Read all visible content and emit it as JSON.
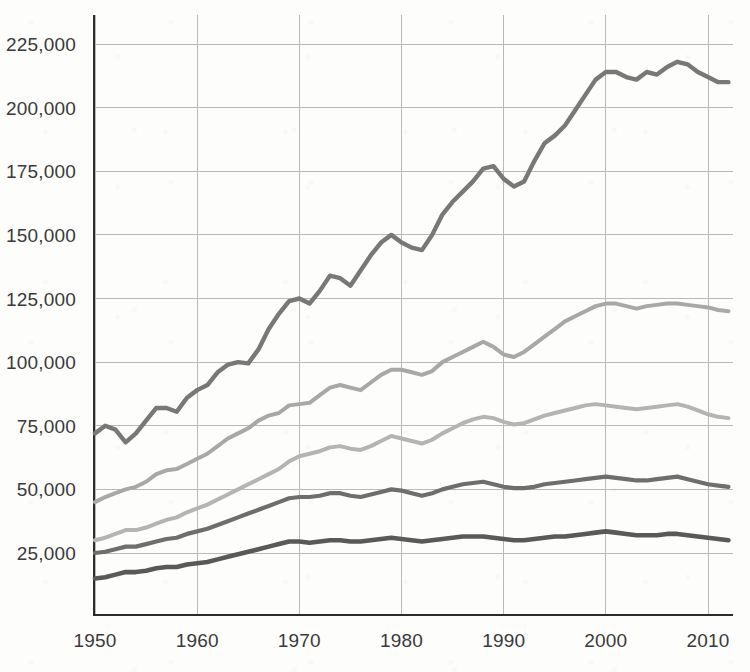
{
  "chart_data": {
    "type": "line",
    "title": "",
    "subtitle": "",
    "xlabel": "",
    "ylabel": "",
    "xlim": [
      1950,
      2012
    ],
    "ylim": [
      0,
      237000
    ],
    "grid": true,
    "legend": "none",
    "y_ticks": [
      25000,
      50000,
      75000,
      100000,
      125000,
      150000,
      175000,
      200000,
      225000
    ],
    "y_tick_labels": [
      "25,000",
      "50,000",
      "75,000",
      "100,000",
      "125,000",
      "150,000",
      "175,000",
      "200,000",
      "225,000"
    ],
    "x_ticks": [
      1950,
      1960,
      1970,
      1980,
      1990,
      2000,
      2010
    ],
    "x_tick_labels": [
      "1950",
      "1960",
      "1970",
      "1980",
      "1990",
      "2000",
      "2010"
    ],
    "x": [
      1950,
      1951,
      1952,
      1953,
      1954,
      1955,
      1956,
      1957,
      1958,
      1959,
      1960,
      1961,
      1962,
      1963,
      1964,
      1965,
      1966,
      1967,
      1968,
      1969,
      1970,
      1971,
      1972,
      1973,
      1974,
      1975,
      1976,
      1977,
      1978,
      1979,
      1980,
      1981,
      1982,
      1983,
      1984,
      1985,
      1986,
      1987,
      1988,
      1989,
      1990,
      1991,
      1992,
      1993,
      1994,
      1995,
      1996,
      1997,
      1998,
      1999,
      2000,
      2001,
      2002,
      2003,
      2004,
      2005,
      2006,
      2007,
      2008,
      2009,
      2010,
      2011,
      2012
    ],
    "series": [
      {
        "name": "series-1-top",
        "color": "#787878",
        "stroke_width": 4.4,
        "values": [
          72000,
          75000,
          73500,
          68500,
          72000,
          77000,
          82000,
          82000,
          80500,
          86000,
          89000,
          91000,
          96000,
          99000,
          100000,
          99500,
          105000,
          113000,
          119000,
          124000,
          125000,
          123000,
          128000,
          134000,
          133000,
          130000,
          136000,
          142000,
          147000,
          150000,
          147000,
          145000,
          144000,
          150000,
          158000,
          163000,
          167000,
          171000,
          176000,
          177000,
          172000,
          169000,
          171000,
          179000,
          186000,
          189000,
          193000,
          199000,
          205000,
          211000,
          214000,
          214000,
          212000,
          211000,
          214000,
          213000,
          216000,
          218000,
          217000,
          214000,
          212000,
          210000,
          210000
        ]
      },
      {
        "name": "series-2",
        "color": "#a8a8a8",
        "stroke_width": 4.0,
        "values": [
          45000,
          47000,
          48500,
          50000,
          51000,
          53000,
          56000,
          57500,
          58000,
          60000,
          62000,
          64000,
          67000,
          70000,
          72000,
          74000,
          77000,
          79000,
          80000,
          83000,
          83500,
          84000,
          87000,
          90000,
          91000,
          90000,
          89000,
          92000,
          95000,
          97000,
          97000,
          96000,
          95000,
          96500,
          100000,
          102000,
          104000,
          106000,
          108000,
          106000,
          103000,
          102000,
          104000,
          107000,
          110000,
          113000,
          116000,
          118000,
          120000,
          122000,
          123000,
          123000,
          122000,
          121000,
          122000,
          122500,
          123000,
          123000,
          122500,
          122000,
          121500,
          120500,
          120000
        ]
      },
      {
        "name": "series-3",
        "color": "#b4b4b4",
        "stroke_width": 4.0,
        "values": [
          30000,
          31000,
          32500,
          34000,
          34000,
          35000,
          36500,
          38000,
          39000,
          41000,
          42500,
          44000,
          46000,
          48000,
          50000,
          52000,
          54000,
          56000,
          58000,
          61000,
          63000,
          64000,
          65000,
          66500,
          67000,
          66000,
          65500,
          67000,
          69000,
          71000,
          70000,
          69000,
          68000,
          69500,
          72000,
          74000,
          76000,
          77500,
          78500,
          78000,
          76500,
          75500,
          76000,
          77500,
          79000,
          80000,
          81000,
          82000,
          83000,
          83500,
          83000,
          82500,
          82000,
          81500,
          82000,
          82500,
          83000,
          83500,
          82500,
          81000,
          79500,
          78500,
          78000
        ]
      },
      {
        "name": "series-4",
        "color": "#6e6e6e",
        "stroke_width": 4.2,
        "values": [
          25000,
          25500,
          26500,
          27500,
          27500,
          28500,
          29500,
          30500,
          31000,
          32500,
          33500,
          34500,
          36000,
          37500,
          39000,
          40500,
          42000,
          43500,
          45000,
          46500,
          47000,
          47000,
          47500,
          48500,
          48500,
          47500,
          47000,
          48000,
          49000,
          50000,
          49500,
          48500,
          47500,
          48500,
          50000,
          51000,
          52000,
          52500,
          53000,
          52000,
          51000,
          50500,
          50500,
          51000,
          52000,
          52500,
          53000,
          53500,
          54000,
          54500,
          55000,
          54500,
          54000,
          53500,
          53500,
          54000,
          54500,
          55000,
          54000,
          53000,
          52000,
          51500,
          51000
        ]
      },
      {
        "name": "series-5-bottom",
        "color": "#595959",
        "stroke_width": 4.6,
        "values": [
          15000,
          15500,
          16500,
          17500,
          17500,
          18000,
          19000,
          19500,
          19500,
          20500,
          21000,
          21500,
          22500,
          23500,
          24500,
          25500,
          26500,
          27500,
          28500,
          29500,
          29500,
          29000,
          29500,
          30000,
          30000,
          29500,
          29500,
          30000,
          30500,
          31000,
          30500,
          30000,
          29500,
          30000,
          30500,
          31000,
          31500,
          31500,
          31500,
          31000,
          30500,
          30000,
          30000,
          30500,
          31000,
          31500,
          31500,
          32000,
          32500,
          33000,
          33500,
          33000,
          32500,
          32000,
          32000,
          32000,
          32500,
          32500,
          32000,
          31500,
          31000,
          30500,
          30000
        ]
      }
    ]
  }
}
